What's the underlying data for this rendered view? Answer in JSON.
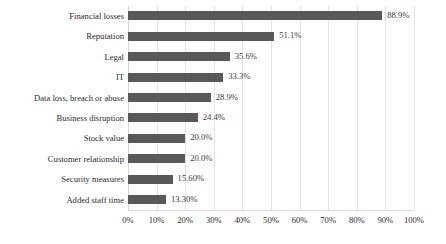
{
  "chart_data": {
    "type": "bar",
    "orientation": "horizontal",
    "title": "",
    "subtitle": "",
    "xlabel": "",
    "ylabel": "",
    "xlim": [
      0,
      100
    ],
    "grid": true,
    "legend": false,
    "legend_position": "none",
    "bar_color": "#595959",
    "gridline_color": "#e4e4e4",
    "label_color": "#2b2b2b",
    "categories": [
      "Financial losses",
      "Reputation",
      "Legal",
      "IT",
      "Data loss, breach or abuse",
      "Business disruption",
      "Stock value",
      "Customer relationship",
      "Security measures",
      "Added staff time"
    ],
    "values": [
      88.9,
      51.1,
      35.6,
      33.3,
      28.9,
      24.4,
      20.0,
      20.0,
      15.6,
      13.3
    ],
    "value_labels": [
      "88.9%",
      "51.1%",
      "35.6%",
      "33.3%",
      "28.9%",
      "24.4%",
      "20.0%",
      "20.0%",
      "15.60%",
      "13.30%"
    ],
    "xticks": [
      0,
      10,
      20,
      30,
      40,
      50,
      60,
      70,
      80,
      90,
      100
    ],
    "xticklabels": [
      "0%",
      "10%",
      "20%",
      "30%",
      "40%",
      "50%",
      "60%",
      "70%",
      "80%",
      "90%",
      "100%"
    ]
  }
}
